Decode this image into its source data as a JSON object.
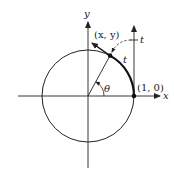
{
  "diagram": {
    "type": "unit-circle-wrapping",
    "labels": {
      "x_axis": "x",
      "y_axis": "y",
      "t_axis": "t",
      "point_xy": "(x, y)",
      "point_10": "(1, 0)",
      "arc_t": "t",
      "angle": "θ"
    },
    "colors": {
      "stroke": "#222222",
      "background": "#ffffff"
    }
  }
}
